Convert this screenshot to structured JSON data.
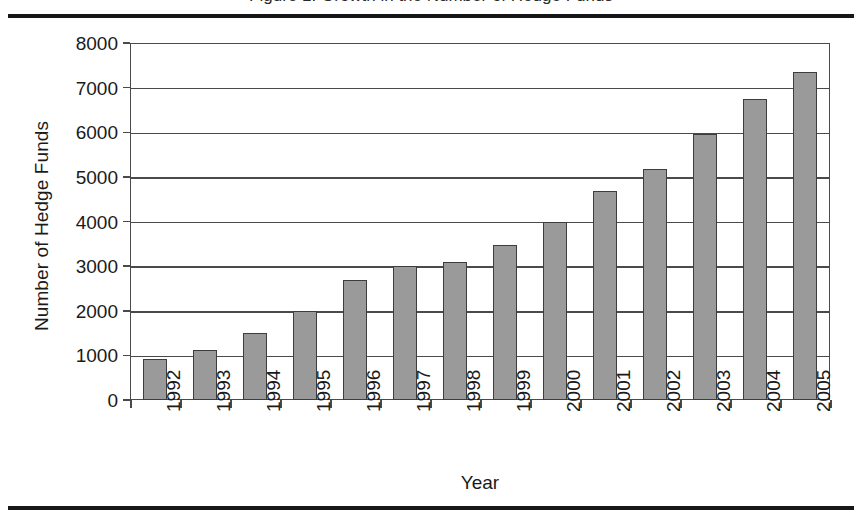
{
  "figure": {
    "caption_fragment": "Figure 1. Growth in the Number of Hedge Funds",
    "rule_color": "#17171a"
  },
  "chart_data": {
    "type": "bar",
    "title": "",
    "xlabel": "Year",
    "ylabel": "Number of Hedge Funds",
    "categories": [
      "1992",
      "1993",
      "1994",
      "1995",
      "1996",
      "1997",
      "1998",
      "1999",
      "2000",
      "2001",
      "2002",
      "2003",
      "2004",
      "2005"
    ],
    "values": [
      930,
      1120,
      1500,
      2000,
      2700,
      3000,
      3100,
      3480,
      3990,
      4680,
      5180,
      5950,
      6750,
      7350
    ],
    "ylim": [
      0,
      8000
    ],
    "yticks": [
      0,
      1000,
      2000,
      3000,
      4000,
      5000,
      6000,
      7000,
      8000
    ],
    "ytick_labels": [
      "0",
      "1000",
      "2000",
      "3000",
      "4000",
      "5000",
      "6000",
      "7000",
      "8000"
    ],
    "grid": true,
    "legend": false,
    "bar_color": "#9a9a9a",
    "bar_edge_color": "#3d3d3d",
    "axis_color": "#4a4a4a"
  }
}
